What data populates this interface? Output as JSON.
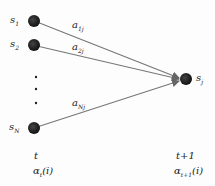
{
  "diagram": {
    "type": "trellis-forward-step",
    "nodes": {
      "s1": {
        "label": "s",
        "sub": "1"
      },
      "s2": {
        "label": "s",
        "sub": "2"
      },
      "sN": {
        "label": "s",
        "sub": "N"
      },
      "sj": {
        "label": "s",
        "sub": "j"
      }
    },
    "edges": [
      {
        "from": "s1",
        "to": "sj",
        "label": "a",
        "sub": "1j"
      },
      {
        "from": "s2",
        "to": "sj",
        "label": "a",
        "sub": "2j"
      },
      {
        "from": "sN",
        "to": "sj",
        "label": "a",
        "sub": "Nj"
      }
    ],
    "ellipsis": "⋮",
    "left_time": "t",
    "left_alpha": {
      "label": "α",
      "sub": "t",
      "arg": "(i)"
    },
    "right_time": "t+1",
    "right_alpha": {
      "label": "α",
      "sub": "t+1",
      "arg": "(i)"
    },
    "colors": {
      "node": "#1a1a1a",
      "edge": "#777777"
    }
  }
}
